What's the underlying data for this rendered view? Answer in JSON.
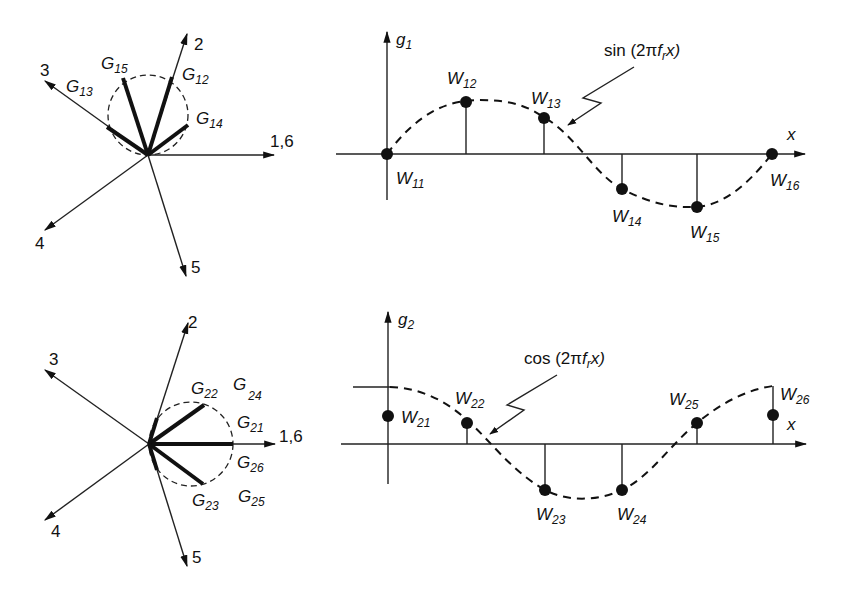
{
  "figure": {
    "panels": [
      {
        "id": "phasor-top",
        "arrows": [
          {
            "label": "1,6"
          },
          {
            "label": "2"
          },
          {
            "label": "3"
          },
          {
            "label": "4"
          },
          {
            "label": "5"
          }
        ],
        "weights": [
          {
            "base": "G",
            "sub": "15"
          },
          {
            "base": "G",
            "sub": "12"
          },
          {
            "base": "G",
            "sub": "13"
          },
          {
            "base": "G",
            "sub": "14"
          }
        ]
      },
      {
        "id": "waveform-top",
        "axis_y": {
          "base": "g",
          "sub": "1"
        },
        "axis_x": "x",
        "annotation": {
          "pre": "sin (2π",
          "f": "f",
          "fsub": "r",
          "post": "x)"
        },
        "samples": [
          {
            "base": "W",
            "sub": "11"
          },
          {
            "base": "W",
            "sub": "12"
          },
          {
            "base": "W",
            "sub": "13"
          },
          {
            "base": "W",
            "sub": "14"
          },
          {
            "base": "W",
            "sub": "15"
          },
          {
            "base": "W",
            "sub": "16"
          }
        ]
      },
      {
        "id": "phasor-bottom",
        "arrows": [
          {
            "label": "1,6"
          },
          {
            "label": "2"
          },
          {
            "label": "3"
          },
          {
            "label": "4"
          },
          {
            "label": "5"
          }
        ],
        "weights": [
          {
            "base": "G",
            "sub": "22"
          },
          {
            "base": "G",
            "sub": "24"
          },
          {
            "base": "G",
            "sub": "21"
          },
          {
            "base": "G",
            "sub": "26"
          },
          {
            "base": "G",
            "sub": "23"
          },
          {
            "base": "G",
            "sub": "25"
          }
        ]
      },
      {
        "id": "waveform-bottom",
        "axis_y": {
          "base": "g",
          "sub": "2"
        },
        "axis_x": "x",
        "annotation": {
          "pre": "cos (2π",
          "f": "f",
          "fsub": "r",
          "post": "x)"
        },
        "samples": [
          {
            "base": "W",
            "sub": "21"
          },
          {
            "base": "W",
            "sub": "22"
          },
          {
            "base": "W",
            "sub": "23"
          },
          {
            "base": "W",
            "sub": "24"
          },
          {
            "base": "W",
            "sub": "25"
          },
          {
            "base": "W",
            "sub": "26"
          }
        ]
      }
    ]
  }
}
